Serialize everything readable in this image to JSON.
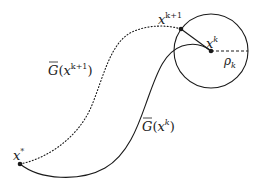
{
  "diagram": {
    "type": "trajectory-trust-region",
    "points": {
      "x_star": {
        "label": "x",
        "sup": "*",
        "x": 20,
        "y": 164
      },
      "x_k": {
        "label": "x",
        "sup": "k",
        "x": 211,
        "y": 51
      },
      "x_k1": {
        "label": "x",
        "sup": "k+1",
        "x": 181,
        "y": 29
      }
    },
    "circle": {
      "cx": 211,
      "cy": 51,
      "r": 37
    },
    "radius_label": {
      "symbol": "ρ",
      "sub": "k"
    },
    "curves": {
      "solid": {
        "label_main": "G",
        "label_open": "(",
        "label_var": "x",
        "label_sup": "k",
        "label_close": ")",
        "style": "solid"
      },
      "dotted": {
        "label_main": "G",
        "label_open": "(",
        "label_var": "x",
        "label_sup": "k+1",
        "label_close": ")",
        "style": "dotted"
      }
    },
    "colors": {
      "stroke": "#1a1a1a",
      "background": "#ffffff"
    }
  }
}
